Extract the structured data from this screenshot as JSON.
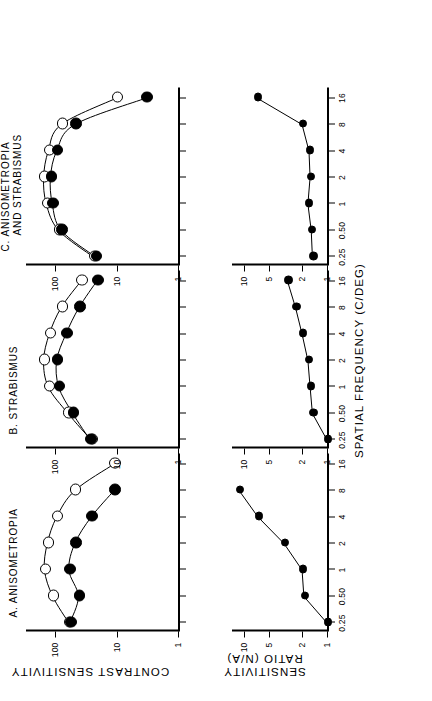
{
  "figure": {
    "xaxis_title": "SPATIAL FREQUENCY (C/DEG)",
    "yaxis_top_title": "CONTRAST SENSITIVITY",
    "yaxis_bottom_title_line1": "SENSITIVITY",
    "yaxis_bottom_title_line2": "RATIO (N/A)"
  },
  "panels": [
    {
      "id": "A",
      "title_line1": "A.  ANISOMETROPIA",
      "title_line2": ""
    },
    {
      "id": "B",
      "title_line1": "B.  STRABISMUS",
      "title_line2": ""
    },
    {
      "id": "C",
      "title_line1": "C.  ANISOMETROPIA",
      "title_line2": "AND  STRABISMUS"
    }
  ],
  "axes": {
    "x_ticks": [
      "0.25",
      "0.50",
      "1",
      "2",
      "4",
      "8",
      "16"
    ],
    "x_tick_values": [
      0.25,
      0.5,
      1,
      2,
      4,
      8,
      16
    ],
    "x_min": 0.2,
    "x_max": 20,
    "cs_ticks": [
      "1",
      "10",
      "100"
    ],
    "cs_tick_values": [
      1,
      10,
      100
    ],
    "cs_min": 1,
    "cs_max": 300,
    "ratio_ticks": [
      "1",
      "2",
      "5",
      "10"
    ],
    "ratio_tick_values": [
      1,
      2,
      5,
      10
    ],
    "ratio_min": 1,
    "ratio_max": 14
  },
  "chart_data": {
    "type": "line",
    "xlabel": "SPATIAL FREQUENCY (C/DEG)",
    "ylabel_top": "CONTRAST SENSITIVITY",
    "ylabel_bottom": "SENSITIVITY RATIO (N/A)",
    "xscale": "log",
    "yscale": "log",
    "xlim": [
      0.2,
      20
    ],
    "ylim_top": [
      1,
      300
    ],
    "ylim_bottom": [
      1,
      14
    ],
    "xticks": [
      0.25,
      0.5,
      1,
      2,
      4,
      8,
      16
    ],
    "xticklabels": [
      "0.25",
      "0.50",
      "1",
      "2",
      "4",
      "8",
      "16"
    ],
    "yticks_top": [
      1,
      10,
      100
    ],
    "yticks_bottom": [
      1,
      2,
      5,
      10
    ],
    "grid": false,
    "legend": null,
    "marker_open": "normal (N) eye",
    "marker_filled": "amblyopic (A) eye",
    "panels": [
      {
        "panel": "A",
        "title": "A. ANISOMETROPIA",
        "series": [
          {
            "name": "normal eye",
            "marker": "open-circle",
            "x": [
              0.25,
              0.5,
              1,
              2,
              4,
              8,
              16
            ],
            "y": [
              60,
              110,
              150,
              135,
              95,
              48,
              11
            ]
          },
          {
            "name": "amblyopic eye",
            "marker": "filled-circle",
            "x": [
              0.25,
              0.5,
              1,
              2,
              4,
              8
            ],
            "y": [
              58,
              42,
              60,
              48,
              26,
              11
            ]
          }
        ]
      },
      {
        "panel": "B",
        "title": "B. STRABISMUS",
        "series": [
          {
            "name": "normal eye",
            "marker": "open-circle",
            "x": [
              0.25,
              0.5,
              1,
              2,
              4,
              8,
              16
            ],
            "y": [
              26,
              62,
              130,
              155,
              125,
              80,
              38
            ]
          },
          {
            "name": "amblyopic eye",
            "marker": "filled-circle",
            "x": [
              0.25,
              0.5,
              1,
              2,
              4,
              8,
              16
            ],
            "y": [
              27,
              52,
              88,
              95,
              67,
              41,
              21
            ]
          }
        ]
      },
      {
        "panel": "C",
        "title": "C. ANISOMETROPIA AND STRABISMUS",
        "series": [
          {
            "name": "normal eye",
            "marker": "open-circle",
            "x": [
              0.25,
              0.5,
              1,
              2,
              4,
              8,
              16
            ],
            "y": [
              24,
              88,
              140,
              155,
              130,
              80,
              10
            ]
          },
          {
            "name": "amblyopic eye",
            "marker": "filled-circle",
            "x": [
              0.25,
              0.5,
              1,
              2,
              4,
              8,
              16
            ],
            "y": [
              22,
              80,
              112,
              120,
              95,
              48,
              3.3
            ]
          }
        ]
      }
    ],
    "ratio_panels": [
      {
        "panel": "A",
        "series": [
          {
            "name": "N/A sensitivity ratio",
            "marker": "filled-circle",
            "x": [
              0.25,
              0.5,
              1,
              2,
              4,
              8
            ],
            "y": [
              1.0,
              1.9,
              2.0,
              3.3,
              6.8,
              11.5
            ]
          }
        ]
      },
      {
        "panel": "B",
        "series": [
          {
            "name": "N/A sensitivity ratio",
            "marker": "filled-circle",
            "x": [
              0.25,
              0.5,
              1,
              2,
              4,
              8,
              16
            ],
            "y": [
              1.0,
              1.5,
              1.6,
              1.7,
              2.0,
              2.4,
              3.0
            ]
          }
        ]
      },
      {
        "panel": "C",
        "series": [
          {
            "name": "N/A sensitivity ratio",
            "marker": "filled-circle",
            "x": [
              0.25,
              0.5,
              1,
              2,
              4,
              8,
              16
            ],
            "y": [
              1.5,
              1.55,
              1.7,
              1.6,
              1.65,
              2.0,
              7.0
            ]
          }
        ]
      }
    ]
  }
}
